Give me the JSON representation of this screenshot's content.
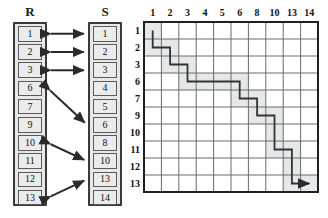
{
  "figure": {
    "type": "sequence-alignment-diagram",
    "lists": [
      {
        "name": "R",
        "title": "R",
        "items": [
          "1",
          "2",
          "3",
          "6",
          "7",
          "9",
          "10",
          "11",
          "12",
          "13"
        ]
      },
      {
        "name": "S",
        "title": "S",
        "items": [
          "1",
          "2",
          "3",
          "4",
          "5",
          "6",
          "8",
          "10",
          "13",
          "14"
        ]
      }
    ],
    "matches": [
      {
        "left": "1",
        "right": "1",
        "style": "horizontal"
      },
      {
        "left": "2",
        "right": "2",
        "style": "horizontal"
      },
      {
        "left": "3",
        "right": "3",
        "style": "horizontal"
      },
      {
        "left": "6",
        "right": "6",
        "style": "diagonal"
      },
      {
        "left": "10",
        "right": "10",
        "style": "diagonal"
      },
      {
        "left": "13",
        "right": "13",
        "style": "diagonal"
      }
    ]
  },
  "chart_data": {
    "type": "heatmap",
    "title": "",
    "xlabel": "",
    "ylabel": "",
    "grid": true,
    "legend": "none",
    "col_labels": [
      "1",
      "2",
      "3",
      "4",
      "5",
      "6",
      "8",
      "10",
      "13",
      "14"
    ],
    "row_labels": [
      "1",
      "2",
      "3",
      "6",
      "7",
      "9",
      "10",
      "11",
      "12",
      "13"
    ],
    "path_nodes": [
      {
        "row": "1",
        "col": "1"
      },
      {
        "row": "2",
        "col": "1"
      },
      {
        "row": "2",
        "col": "2"
      },
      {
        "row": "3",
        "col": "2"
      },
      {
        "row": "3",
        "col": "3"
      },
      {
        "row": "6",
        "col": "3"
      },
      {
        "row": "6",
        "col": "6"
      },
      {
        "row": "7",
        "col": "6"
      },
      {
        "row": "7",
        "col": "8"
      },
      {
        "row": "9",
        "col": "8"
      },
      {
        "row": "9",
        "col": "10"
      },
      {
        "row": "11",
        "col": "10"
      },
      {
        "row": "11",
        "col": "13"
      },
      {
        "row": "13",
        "col": "13"
      },
      {
        "row": "13",
        "col": "14"
      }
    ],
    "path_arrow_end": {
      "row": "13",
      "col": "14"
    },
    "shaded_cells": [
      {
        "row": "1",
        "col": "1"
      },
      {
        "row": "2",
        "col": "1"
      },
      {
        "row": "2",
        "col": "2"
      },
      {
        "row": "3",
        "col": "2"
      },
      {
        "row": "3",
        "col": "3"
      },
      {
        "row": "6",
        "col": "3"
      },
      {
        "row": "6",
        "col": "4"
      },
      {
        "row": "6",
        "col": "5"
      },
      {
        "row": "6",
        "col": "6"
      },
      {
        "row": "7",
        "col": "6"
      },
      {
        "row": "7",
        "col": "8"
      },
      {
        "row": "9",
        "col": "8"
      },
      {
        "row": "9",
        "col": "10"
      },
      {
        "row": "10",
        "col": "10"
      },
      {
        "row": "11",
        "col": "10"
      },
      {
        "row": "11",
        "col": "13"
      },
      {
        "row": "12",
        "col": "13"
      },
      {
        "row": "13",
        "col": "13"
      },
      {
        "row": "13",
        "col": "14"
      }
    ]
  },
  "colors": {
    "line": "#333333",
    "grid_line": "#6b6b6b",
    "grid_border": "#1f1f1f",
    "cell_fill": "#ebebeb",
    "frame_fill": "#e8e8e8",
    "shade": "#e4e8e9",
    "text": "#111111"
  }
}
